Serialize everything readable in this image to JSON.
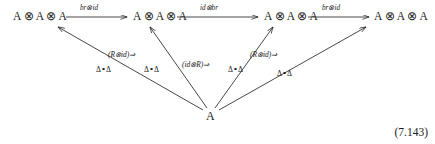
{
  "figure": {
    "type": "commutative-diagram",
    "equation_number": "(7.143)",
    "top_nodes": [
      {
        "id": "n0",
        "label": "A ⊗ A ⊗ A"
      },
      {
        "id": "n1",
        "label": "A ⊗ A ⊗ A"
      },
      {
        "id": "n2",
        "label": "A ⊗ A ⊗ A"
      },
      {
        "id": "n3",
        "label": "A ⊗ A ⊗ A"
      }
    ],
    "bottom_node": {
      "id": "a",
      "label": "A"
    },
    "horizontal_arrows": [
      {
        "from": "n0",
        "to": "n1",
        "label": "br⊗id"
      },
      {
        "from": "n1",
        "to": "n2",
        "label": "id⊗br"
      },
      {
        "from": "n2",
        "to": "n3",
        "label": "br⊗id"
      }
    ],
    "diagonal_arrows": [
      {
        "from": "a",
        "to": "n0",
        "label": "Δ∘Δ"
      },
      {
        "from": "a",
        "to": "n1",
        "label": "Δ∘Δ"
      },
      {
        "from": "a",
        "to": "n2",
        "label": "Δ∘Δ"
      },
      {
        "from": "a",
        "to": "n3",
        "label": "Δ∘Δ"
      }
    ],
    "two_cells": [
      {
        "label": "(R⊗id)⇒"
      },
      {
        "label": "(id⊗R)⇒"
      },
      {
        "label": "(R⊗id)⇒"
      }
    ],
    "colors": {
      "ink": "#1b1b1b",
      "background": "#ffffff"
    }
  }
}
